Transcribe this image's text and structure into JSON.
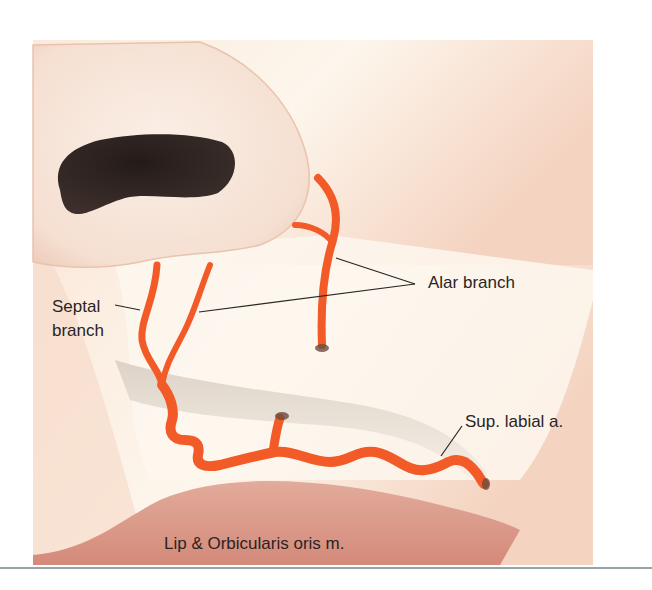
{
  "figure": {
    "colors": {
      "background": "#ffffff",
      "skin_light": "#fdf5ea",
      "skin_warm": "#f3d2bf",
      "nose": "#f7e6da",
      "nostril": "#2f2624",
      "artery": "#f25a28",
      "lip": "#d99484",
      "rule": "#9aa4a8"
    },
    "labels": {
      "alar": "Alar branch",
      "septal_line1": "Septal",
      "septal_line2": "branch",
      "sup_labial": "Sup. labial a.",
      "lip": "Lip & Orbicularis oris m."
    }
  }
}
